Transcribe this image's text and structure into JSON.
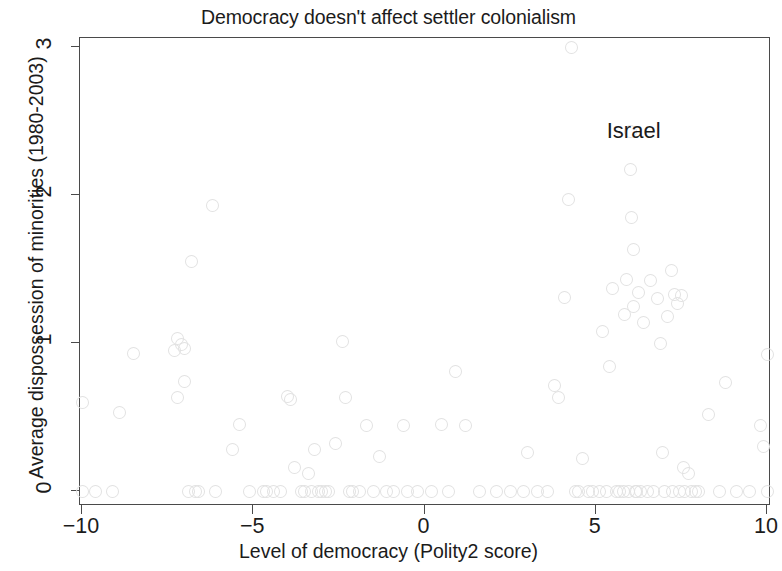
{
  "chart_data": {
    "type": "scatter",
    "title": "Democracy doesn't affect settler colonialism",
    "xlabel": "Level of democracy (Polity2 score)",
    "ylabel": "Average dispossession of minorities (1980-2003)",
    "xlim": [
      -10.5,
      10.4
    ],
    "ylim": [
      -0.1,
      3.12
    ],
    "xticks": [
      -10,
      -5,
      0,
      5,
      10
    ],
    "xticklabels": [
      "−10",
      "−5",
      "0",
      "5",
      "10"
    ],
    "yticks": [
      0,
      1,
      2,
      3
    ],
    "yticklabels": [
      "0",
      "1",
      "2",
      "3"
    ],
    "grid": false,
    "legend": null,
    "marker": "open-diamond-circle",
    "marker_color": "#e2e2e2",
    "annotations": [
      {
        "text": "Israel",
        "x": 5.35,
        "y": 2.42
      }
    ],
    "points": [
      [
        -10.0,
        0.6
      ],
      [
        -10.0,
        0.0
      ],
      [
        -9.6,
        0.0
      ],
      [
        -9.1,
        0.0
      ],
      [
        -8.9,
        0.53
      ],
      [
        -8.5,
        0.93
      ],
      [
        -7.3,
        0.95
      ],
      [
        -7.2,
        1.03
      ],
      [
        -7.1,
        0.99
      ],
      [
        -7.0,
        0.96
      ],
      [
        -7.0,
        0.74
      ],
      [
        -7.2,
        0.63
      ],
      [
        -6.9,
        0.0
      ],
      [
        -6.8,
        1.55
      ],
      [
        -6.7,
        0.0
      ],
      [
        -6.6,
        0.0
      ],
      [
        -6.2,
        1.93
      ],
      [
        -6.1,
        0.0
      ],
      [
        -5.6,
        0.28
      ],
      [
        -5.4,
        0.45
      ],
      [
        -5.1,
        0.0
      ],
      [
        -4.7,
        0.0
      ],
      [
        -4.6,
        0.0
      ],
      [
        -4.4,
        0.0
      ],
      [
        -4.2,
        0.0
      ],
      [
        -4.0,
        0.64
      ],
      [
        -3.9,
        0.62
      ],
      [
        -3.8,
        0.16
      ],
      [
        -3.6,
        0.0
      ],
      [
        -3.5,
        0.0
      ],
      [
        -3.4,
        0.12
      ],
      [
        -3.3,
        0.0
      ],
      [
        -3.2,
        0.28
      ],
      [
        -3.1,
        0.0
      ],
      [
        -3.0,
        0.0
      ],
      [
        -2.9,
        0.0
      ],
      [
        -2.8,
        0.0
      ],
      [
        -2.6,
        0.32
      ],
      [
        -2.4,
        1.01
      ],
      [
        -2.3,
        0.63
      ],
      [
        -2.2,
        0.0
      ],
      [
        -2.1,
        0.0
      ],
      [
        -1.9,
        0.0
      ],
      [
        -1.7,
        0.44
      ],
      [
        -1.5,
        0.0
      ],
      [
        -1.3,
        0.23
      ],
      [
        -1.1,
        0.0
      ],
      [
        -0.9,
        0.0
      ],
      [
        -0.6,
        0.44
      ],
      [
        -0.5,
        0.0
      ],
      [
        -0.2,
        0.0
      ],
      [
        0.2,
        0.0
      ],
      [
        0.5,
        0.45
      ],
      [
        0.7,
        0.0
      ],
      [
        0.9,
        0.81
      ],
      [
        1.2,
        0.44
      ],
      [
        1.6,
        0.0
      ],
      [
        2.1,
        0.0
      ],
      [
        2.5,
        0.0
      ],
      [
        2.9,
        0.0
      ],
      [
        3.0,
        0.26
      ],
      [
        3.3,
        0.0
      ],
      [
        3.6,
        0.0
      ],
      [
        3.8,
        0.71
      ],
      [
        3.9,
        0.63
      ],
      [
        4.1,
        1.31
      ],
      [
        4.2,
        1.97
      ],
      [
        4.3,
        3.0
      ],
      [
        4.4,
        0.0
      ],
      [
        4.5,
        0.0
      ],
      [
        4.6,
        0.22
      ],
      [
        4.8,
        0.0
      ],
      [
        4.9,
        0.0
      ],
      [
        5.1,
        0.0
      ],
      [
        5.2,
        1.08
      ],
      [
        5.3,
        0.0
      ],
      [
        5.4,
        0.84
      ],
      [
        5.5,
        1.37
      ],
      [
        5.6,
        0.0
      ],
      [
        5.7,
        0.0
      ],
      [
        5.8,
        0.0
      ],
      [
        5.85,
        1.19
      ],
      [
        5.9,
        1.43
      ],
      [
        5.95,
        0.0
      ],
      [
        6.0,
        2.43
      ],
      [
        6.0,
        2.17
      ],
      [
        6.05,
        1.85
      ],
      [
        6.1,
        1.63
      ],
      [
        6.1,
        1.25
      ],
      [
        6.15,
        0.0
      ],
      [
        6.2,
        0.0
      ],
      [
        6.25,
        1.34
      ],
      [
        6.3,
        0.0
      ],
      [
        6.4,
        1.14
      ],
      [
        6.5,
        0.0
      ],
      [
        6.6,
        1.42
      ],
      [
        6.7,
        0.0
      ],
      [
        6.8,
        1.3
      ],
      [
        6.9,
        1.0
      ],
      [
        6.95,
        0.26
      ],
      [
        7.0,
        0.0
      ],
      [
        7.1,
        1.18
      ],
      [
        7.2,
        1.49
      ],
      [
        7.25,
        0.0
      ],
      [
        7.3,
        1.33
      ],
      [
        7.4,
        1.27
      ],
      [
        7.45,
        0.0
      ],
      [
        7.5,
        1.32
      ],
      [
        7.55,
        0.16
      ],
      [
        7.6,
        0.0
      ],
      [
        7.7,
        0.12
      ],
      [
        7.8,
        0.0
      ],
      [
        7.9,
        0.0
      ],
      [
        8.0,
        0.0
      ],
      [
        8.3,
        0.52
      ],
      [
        8.6,
        0.0
      ],
      [
        8.8,
        0.73
      ],
      [
        9.1,
        0.0
      ],
      [
        9.5,
        0.0
      ],
      [
        9.8,
        0.44
      ],
      [
        9.9,
        0.3
      ],
      [
        10.0,
        0.92
      ],
      [
        10.0,
        0.0
      ]
    ]
  }
}
